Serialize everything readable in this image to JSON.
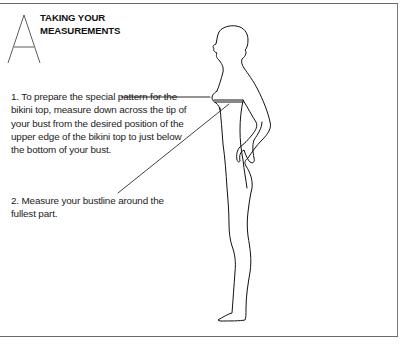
{
  "page": {
    "drop_cap": "A",
    "heading": {
      "line1": "TAKING YOUR",
      "line2": "MEASUREMENTS"
    },
    "steps": [
      {
        "number": "1.",
        "text": "1. To prepare the special pattern for the bikini top, measure down across the tip of your bust from the desired position of the upper edge of the bikini top to just below the bottom of your bust."
      },
      {
        "number": "2.",
        "text": "2. Measure your bustline around the fullest part."
      }
    ],
    "illustration": {
      "subject": "woman-side-profile-figure",
      "callouts": [
        "bikini-top-depth-line",
        "bustline-line"
      ]
    }
  }
}
